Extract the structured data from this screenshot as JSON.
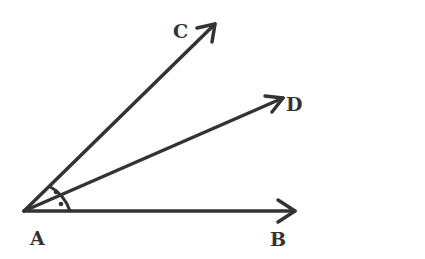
{
  "diagram": {
    "type": "angle-bisector",
    "stroke_color": "#333333",
    "background": "#ffffff",
    "vertex": {
      "label": "A",
      "x": 24,
      "y": 211
    },
    "rays": [
      {
        "label": "B",
        "tip": [
          296,
          211
        ]
      },
      {
        "label": "C",
        "tip": [
          216,
          23
        ]
      },
      {
        "label": "D",
        "tip": [
          284,
          98
        ]
      }
    ],
    "angle_marks": {
      "arcs": "equal angles marked with dots",
      "dots": 2
    }
  },
  "labels": {
    "a": "A",
    "b": "B",
    "c": "C",
    "d": "D"
  }
}
